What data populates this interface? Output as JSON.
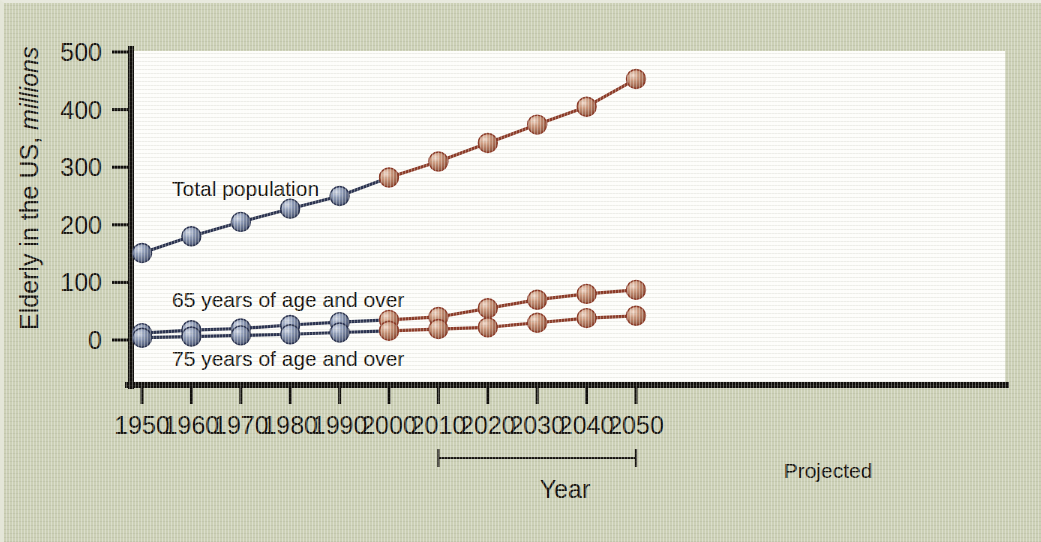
{
  "figure": {
    "background_color": "#ccd0b6",
    "plot_background_color": "#fdfdfa",
    "axis_color": "#100e0b"
  },
  "axes": {
    "y_title_main": "Elderly in the US, ",
    "y_title_emphasis": "millions",
    "x_title": "Year",
    "y_ticks": [
      "0",
      "100",
      "200",
      "300",
      "400",
      "500"
    ],
    "x_ticks": [
      "1950",
      "1960",
      "1970",
      "1980",
      "1990",
      "2000",
      "2010",
      "2020",
      "2030",
      "2040",
      "2050"
    ]
  },
  "annotations": {
    "projected_label": "Projected",
    "projected_from": "2010",
    "projected_to": "2050",
    "series_label_total": "Total population",
    "series_label_65": "65 years of age and over",
    "series_label_75": "75 years of age and over"
  },
  "colors": {
    "historical_line": "#2b3350",
    "historical_marker": "#7d89a8",
    "projected_line": "#8c3b28",
    "projected_marker": "#c08a70"
  },
  "chart_data": {
    "type": "line",
    "title": "",
    "xlabel": "Year",
    "ylabel": "Elderly in the US, millions",
    "x": [
      1950,
      1960,
      1970,
      1980,
      1990,
      2000,
      2010,
      2020,
      2030,
      2040,
      2050
    ],
    "xlim": [
      1950,
      2050
    ],
    "ylim": [
      0,
      500
    ],
    "yticks": [
      0,
      100,
      200,
      300,
      400,
      500
    ],
    "grid": false,
    "legend": "inline-annotations",
    "historical_through": 2000,
    "projected_from": 2010,
    "series": [
      {
        "name": "Total population",
        "values": [
          151,
          180,
          205,
          228,
          250,
          282,
          310,
          342,
          374,
          405,
          453
        ]
      },
      {
        "name": "65 years of age and over",
        "values": [
          12,
          17,
          20,
          26,
          31,
          35,
          40,
          55,
          70,
          80,
          87
        ]
      },
      {
        "name": "75 years of age and over",
        "values": [
          4,
          6,
          8,
          10,
          13,
          16,
          19,
          22,
          30,
          38,
          42
        ]
      }
    ],
    "annotations": [
      {
        "text": "Projected",
        "x_start": 2010,
        "x_end": 2050,
        "type": "bracket"
      }
    ]
  }
}
